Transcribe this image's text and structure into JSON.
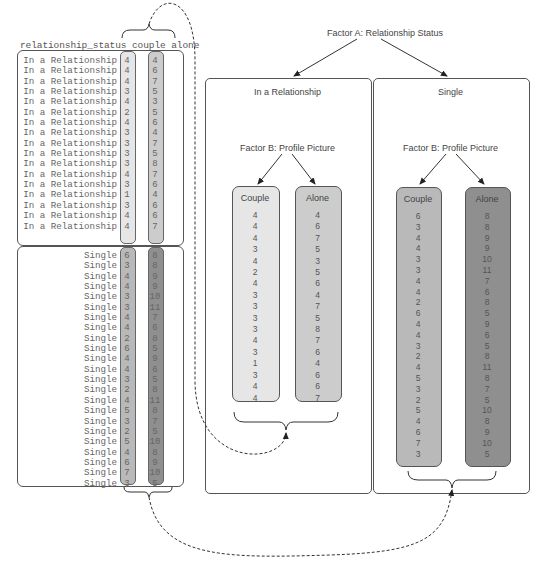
{
  "table": {
    "header": "relationship_status couple alone",
    "columns": [
      "relationship_status",
      "couple",
      "alone"
    ],
    "groups": [
      {
        "status": "In a Relationship",
        "rows": [
          {
            "status": "In a Relationship",
            "couple": "4",
            "alone": "4"
          },
          {
            "status": "In a Relationship",
            "couple": "4",
            "alone": "6"
          },
          {
            "status": "In a Relationship",
            "couple": "4",
            "alone": "7"
          },
          {
            "status": "In a Relationship",
            "couple": "3",
            "alone": "5"
          },
          {
            "status": "In a Relationship",
            "couple": "4",
            "alone": "3"
          },
          {
            "status": "In a Relationship",
            "couple": "2",
            "alone": "5"
          },
          {
            "status": "In a Relationship",
            "couple": "4",
            "alone": "6"
          },
          {
            "status": "In a Relationship",
            "couple": "3",
            "alone": "4"
          },
          {
            "status": "In a Relationship",
            "couple": "3",
            "alone": "7"
          },
          {
            "status": "In a Relationship",
            "couple": "3",
            "alone": "5"
          },
          {
            "status": "In a Relationship",
            "couple": "3",
            "alone": "8"
          },
          {
            "status": "In a Relationship",
            "couple": "4",
            "alone": "7"
          },
          {
            "status": "In a Relationship",
            "couple": "3",
            "alone": "6"
          },
          {
            "status": "In a Relationship",
            "couple": "1",
            "alone": "4"
          },
          {
            "status": "In a Relationship",
            "couple": "3",
            "alone": "6"
          },
          {
            "status": "In a Relationship",
            "couple": "4",
            "alone": "6"
          },
          {
            "status": "In a Relationship",
            "couple": "4",
            "alone": "7"
          }
        ]
      },
      {
        "status": "Single",
        "rows": [
          {
            "status": "Single",
            "couple": "6",
            "alone": "8"
          },
          {
            "status": "Single",
            "couple": "3",
            "alone": "8"
          },
          {
            "status": "Single",
            "couple": "4",
            "alone": "9"
          },
          {
            "status": "Single",
            "couple": "4",
            "alone": "9"
          },
          {
            "status": "Single",
            "couple": "3",
            "alone": "10"
          },
          {
            "status": "Single",
            "couple": "3",
            "alone": "11"
          },
          {
            "status": "Single",
            "couple": "4",
            "alone": "7"
          },
          {
            "status": "Single",
            "couple": "4",
            "alone": "6"
          },
          {
            "status": "Single",
            "couple": "2",
            "alone": "8"
          },
          {
            "status": "Single",
            "couple": "6",
            "alone": "5"
          },
          {
            "status": "Single",
            "couple": "4",
            "alone": "9"
          },
          {
            "status": "Single",
            "couple": "4",
            "alone": "6"
          },
          {
            "status": "Single",
            "couple": "3",
            "alone": "5"
          },
          {
            "status": "Single",
            "couple": "2",
            "alone": "8"
          },
          {
            "status": "Single",
            "couple": "4",
            "alone": "11"
          },
          {
            "status": "Single",
            "couple": "5",
            "alone": "8"
          },
          {
            "status": "Single",
            "couple": "3",
            "alone": "7"
          },
          {
            "status": "Single",
            "couple": "2",
            "alone": "5"
          },
          {
            "status": "Single",
            "couple": "5",
            "alone": "10"
          },
          {
            "status": "Single",
            "couple": "4",
            "alone": "8"
          },
          {
            "status": "Single",
            "couple": "6",
            "alone": "9"
          },
          {
            "status": "Single",
            "couple": "7",
            "alone": "10"
          },
          {
            "status": "Single",
            "couple": "3",
            "alone": "5"
          }
        ]
      }
    ]
  },
  "diagram": {
    "factor_a": "Factor A: Relationship Status",
    "panels": [
      {
        "title": "In a Relationship",
        "factor_b": "Factor B: Profile Picture",
        "groups": [
          {
            "title": "Couple",
            "values": "4\n4\n4\n3\n4\n2\n4\n3\n3\n3\n3\n4\n3\n1\n3\n4\n4"
          },
          {
            "title": "Alone",
            "values": "4\n6\n7\n5\n3\n5\n6\n4\n7\n5\n8\n7\n6\n4\n6\n6\n7"
          }
        ]
      },
      {
        "title": "Single",
        "factor_b": "Factor B: Profile Picture",
        "groups": [
          {
            "title": "Couple",
            "values": "6\n3\n4\n4\n3\n3\n4\n4\n2\n6\n4\n4\n3\n2\n4\n5\n3\n2\n5\n4\n6\n7\n3"
          },
          {
            "title": "Alone",
            "values": "8\n8\n9\n9\n10\n11\n7\n6\n8\n5\n9\n6\n5\n8\n11\n8\n7\n5\n10\n8\n9\n10\n5"
          }
        ]
      }
    ]
  },
  "colors": {
    "rel_couple": "#e6e6e6",
    "rel_alone": "#cccccc",
    "single_couple": "#b9b9b9",
    "single_alone": "#8f8f8f",
    "border": "#555555"
  }
}
